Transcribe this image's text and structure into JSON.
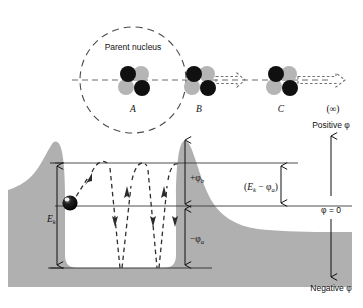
{
  "figure": {
    "colors": {
      "barrier_fill": "#b0b0b0",
      "ink": "#111111",
      "proton": "#101010",
      "neutron": "#b5b5b5",
      "ball": "#050505",
      "line": "#333333"
    }
  },
  "upper": {
    "parent_nucleus_label": "Parent nucleus",
    "positions": [
      {
        "id": "A",
        "label": "A",
        "x": 133,
        "y": 80
      },
      {
        "id": "B",
        "label": "B",
        "x": 199,
        "y": 80
      },
      {
        "id": "C",
        "label": "C",
        "x": 281,
        "y": 80
      },
      {
        "id": "infinity",
        "label": "(∞)",
        "x": 333,
        "y": 80
      }
    ],
    "particle_charge_glyph": "+",
    "arrows": [
      {
        "from": "B",
        "length": "short"
      },
      {
        "from": "C",
        "length": "long"
      }
    ]
  },
  "lower": {
    "labels": {
      "phi_b": "+φ",
      "phi_b_sub": "b",
      "phi_a": "−φ",
      "phi_a_sub": "a",
      "ek": "E",
      "ek_sub": "k",
      "ek_minus_phi_a_open": "(",
      "ek_minus_phi_a_E": "E",
      "ek_minus_phi_a_k": "k",
      "ek_minus_phi_a_minus": " − ",
      "ek_minus_phi_a_phi": "φ",
      "ek_minus_phi_a_a": "a",
      "ek_minus_phi_a_close": ")"
    }
  },
  "scale": {
    "positive_label": "Positive φ",
    "zero_label": "φ = 0",
    "negative_label": "Negative φ"
  }
}
